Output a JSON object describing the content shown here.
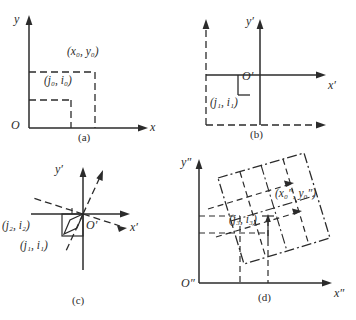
{
  "figure": {
    "panels": [
      {
        "id": "a",
        "caption": "(a)",
        "axes": {
          "x": "x",
          "y": "y",
          "origin": "O"
        },
        "labels": [
          {
            "name": "point-xy",
            "text": "(x₀, y₀)"
          },
          {
            "name": "point-ji",
            "text": "(j₀, i₀)"
          }
        ]
      },
      {
        "id": "b",
        "caption": "(b)",
        "axes": {
          "x": "x′",
          "y": "y′",
          "origin": "O′"
        },
        "labels": [
          {
            "name": "point-ji",
            "text": "(j₁, i₁)"
          }
        ]
      },
      {
        "id": "c",
        "caption": "(c)",
        "axes": {
          "x": "x′",
          "y": "y′",
          "origin": "O′"
        },
        "labels": [
          {
            "name": "point-ji-2",
            "text": "(j₂, i₂)"
          },
          {
            "name": "point-ji-1",
            "text": "(j₁, i₁)"
          }
        ]
      },
      {
        "id": "d",
        "caption": "(d)",
        "axes": {
          "x": "x″",
          "y": "y″",
          "origin": "O″"
        },
        "labels": [
          {
            "name": "point-xy",
            "text": "(x₀″, y₀″)"
          },
          {
            "name": "point-ji",
            "text": "(j₃, i₃)"
          }
        ]
      }
    ]
  },
  "colors": {
    "stroke": "#2b2b2b",
    "background": "#ffffff"
  }
}
